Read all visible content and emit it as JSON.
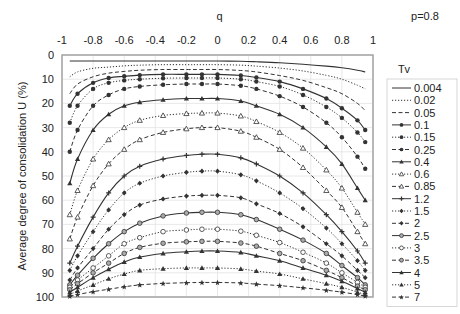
{
  "chart_data": {
    "type": "line",
    "title": "",
    "annotation": "p=0.8",
    "xlabel": "q",
    "ylabel": "Average degree of consolidation U (%)",
    "xlim": [
      -1,
      1
    ],
    "ylim": [
      0,
      100
    ],
    "y_inverted": true,
    "x_axis_position": "top",
    "xticks": [
      "-1",
      "-0.8",
      "-0.6",
      "-0.4",
      "-0.2",
      "0",
      "0.2",
      "0.4",
      "0.6",
      "0.8",
      "1"
    ],
    "yticks": [
      "0",
      "10",
      "20",
      "30",
      "40",
      "50",
      "60",
      "70",
      "80",
      "90",
      "100"
    ],
    "grid": true,
    "legend_title": "Tv",
    "legend_position": "right",
    "x": [
      -0.95,
      -0.9,
      -0.8,
      -0.7,
      -0.6,
      -0.5,
      -0.35,
      -0.2,
      -0.1,
      0,
      0.15,
      0.25,
      0.4,
      0.55,
      0.7,
      0.8,
      0.9,
      0.95
    ],
    "series": [
      {
        "name": "0.004",
        "style": "solid",
        "marker": "none",
        "values": [
          2.5,
          2.5,
          2.5,
          2.5,
          2.5,
          2.5,
          2.5,
          2.5,
          2.5,
          2.5,
          2.6,
          2.8,
          3.2,
          3.8,
          4.6,
          5.3,
          6.3,
          7.0
        ]
      },
      {
        "name": "0.02",
        "style": "dotted",
        "marker": "none",
        "values": [
          9,
          7,
          5.5,
          5,
          4.5,
          4.2,
          4,
          4,
          4,
          4,
          4.2,
          4.6,
          5.4,
          6.6,
          8.4,
          10,
          12.5,
          14
        ]
      },
      {
        "name": "0.05",
        "style": "dashed",
        "marker": "none",
        "values": [
          16,
          12,
          9,
          7.5,
          6.8,
          6.3,
          6,
          6,
          6,
          6,
          6.4,
          7,
          8.5,
          10.5,
          13.5,
          16,
          20,
          23
        ]
      },
      {
        "name": "0.1",
        "style": "solid",
        "marker": "filled-circle",
        "values": [
          21,
          16,
          11.5,
          9.5,
          8.8,
          8.3,
          8,
          8,
          8,
          8,
          8.5,
          9.3,
          11,
          14,
          18,
          22,
          27,
          31
        ]
      },
      {
        "name": "0.15",
        "style": "dotted",
        "marker": "filled-circle",
        "values": [
          28,
          21,
          14,
          11.5,
          10.5,
          10,
          9.6,
          9.5,
          9.5,
          9.5,
          10,
          11,
          13,
          16.5,
          21.5,
          26,
          32,
          36
        ]
      },
      {
        "name": "0.25",
        "style": "dashed",
        "marker": "filled-circle",
        "values": [
          40,
          31,
          21,
          16.5,
          14,
          13,
          12.3,
          12,
          12,
          12,
          12.7,
          14,
          17,
          21.5,
          28,
          34,
          42,
          47
        ]
      },
      {
        "name": "0.4",
        "style": "solid",
        "marker": "filled-triangle",
        "values": [
          53,
          43,
          31,
          24.5,
          21,
          19.5,
          18.5,
          18,
          18,
          18,
          19,
          21,
          24.5,
          30,
          38,
          45,
          55,
          60
        ]
      },
      {
        "name": "0.6",
        "style": "dotted",
        "marker": "open-triangle",
        "values": [
          66,
          56,
          43,
          35,
          30,
          27,
          25,
          24.2,
          24,
          24,
          25.2,
          27.5,
          32,
          38.5,
          47.5,
          55,
          65,
          70
        ]
      },
      {
        "name": "0.85",
        "style": "dashed",
        "marker": "open-triangle",
        "values": [
          76,
          67,
          54,
          45,
          39,
          35,
          32,
          30.5,
          30,
          30,
          31.5,
          34,
          39,
          46.5,
          56,
          63,
          73,
          78
        ]
      },
      {
        "name": "1.2",
        "style": "solid",
        "marker": "cross",
        "values": [
          86,
          79,
          67,
          57,
          50,
          46,
          43,
          41.5,
          41,
          41,
          42.5,
          45,
          50,
          57,
          66,
          73,
          81,
          86
        ]
      },
      {
        "name": "1.5",
        "style": "dotted",
        "marker": "filled-diamond",
        "values": [
          89,
          83,
          73,
          64,
          57,
          53,
          50,
          48.5,
          48,
          48,
          49.5,
          52,
          57,
          63.5,
          71.5,
          78,
          85,
          89
        ]
      },
      {
        "name": "2",
        "style": "dashed",
        "marker": "filled-diamond",
        "values": [
          93,
          88,
          80,
          72,
          66,
          62,
          59.5,
          58.3,
          58,
          58,
          59,
          61.5,
          65.5,
          71,
          78,
          83,
          89,
          92
        ]
      },
      {
        "name": "2.5",
        "style": "solid",
        "marker": "open-circle-dot",
        "values": [
          95,
          91,
          84,
          78,
          73,
          69.5,
          66.5,
          65.3,
          65,
          65,
          66,
          68,
          72,
          76.5,
          82,
          87,
          92,
          95
        ]
      },
      {
        "name": "3",
        "style": "dotted",
        "marker": "open-circle",
        "values": [
          96,
          93,
          88,
          83,
          78,
          75.5,
          73,
          72.3,
          72,
          72,
          72.8,
          74.5,
          77.5,
          81.5,
          86,
          90,
          94,
          96
        ]
      },
      {
        "name": "3.5",
        "style": "dashed",
        "marker": "open-circle-dot",
        "values": [
          97,
          94.5,
          90,
          86,
          82,
          79.5,
          77.8,
          77.2,
          77,
          77,
          77.7,
          79,
          82,
          85,
          89,
          92,
          95.5,
          97
        ]
      },
      {
        "name": "4",
        "style": "solid",
        "marker": "filled-triangle",
        "values": [
          98,
          96,
          92,
          88.5,
          85.5,
          83.5,
          82,
          81.3,
          81,
          81,
          81.6,
          83,
          85,
          88,
          91,
          93.5,
          96.5,
          98
        ]
      },
      {
        "name": "5",
        "style": "dotted",
        "marker": "filled-triangle",
        "values": [
          99,
          97.5,
          95,
          92.5,
          90.5,
          89,
          88.3,
          88,
          88,
          88,
          88.4,
          89.3,
          90.5,
          92.5,
          94.5,
          96,
          98,
          99
        ]
      },
      {
        "name": "7",
        "style": "dashed",
        "marker": "star",
        "values": [
          99.7,
          99,
          97.8,
          96.8,
          95.8,
          95,
          94.4,
          94.1,
          94,
          94,
          94.2,
          94.7,
          95.3,
          96.2,
          97.2,
          98,
          99,
          99.6
        ]
      }
    ]
  }
}
